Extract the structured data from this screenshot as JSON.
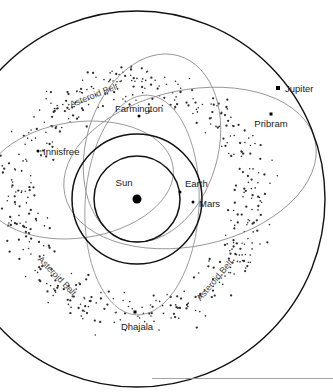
{
  "figure": {
    "kind": "solar-system-meteorite-orbit-diagram",
    "background": "#ffffff",
    "ink": "#111111",
    "meteor_orbit_color": "#8e8e8e",
    "belt_dot_color": "#2e2e2e"
  },
  "bodies": {
    "sun": {
      "label": "Sun"
    },
    "earth": {
      "label": "Earth"
    },
    "mars": {
      "label": "Mars"
    },
    "jupiter": {
      "label": "Jupiter"
    }
  },
  "meteorites": {
    "innisfree": {
      "label": "Innisfree"
    },
    "farmington": {
      "label": "Farmington"
    },
    "pribram": {
      "label": "Pribram"
    },
    "dhajala": {
      "label": "Dhajala"
    }
  },
  "belt_labels": [
    {
      "label": "Asteroid Belt"
    },
    {
      "label": "Asteroid Belt"
    },
    {
      "label": "Asteroid Belt"
    }
  ],
  "chart_data": {
    "type": "scatter",
    "title": "",
    "xlabel": "",
    "ylabel": "",
    "grid": false,
    "legend": "none",
    "center": {
      "x": 137,
      "y": 199
    },
    "circular_orbits": [
      {
        "name": "Earth",
        "radius_px": 43
      },
      {
        "name": "Mars",
        "radius_px": 65
      },
      {
        "name": "Jupiter",
        "radius_px": 188
      }
    ],
    "elliptical_orbits": [
      {
        "name": "Innisfree",
        "rx_px": 96,
        "ry_px": 58,
        "rotation_deg": -8,
        "cx": 78,
        "cy": 180
      },
      {
        "name": "Farmington",
        "rx_px": 66,
        "ry_px": 96,
        "rotation_deg": 16,
        "cx": 152,
        "cy": 148
      },
      {
        "name": "Pribram",
        "rx_px": 128,
        "ry_px": 78,
        "rotation_deg": -12,
        "cx": 190,
        "cy": 168
      },
      {
        "name": "Dhajala",
        "rx_px": 57,
        "ry_px": 110,
        "rotation_deg": 3,
        "cx": 142,
        "cy": 205
      }
    ],
    "point_markers": [
      {
        "name": "Sun",
        "x": 137,
        "y": 199,
        "shape": "disc",
        "size_px": 9
      },
      {
        "name": "Earth",
        "x": 180,
        "y": 192,
        "shape": "dot",
        "size_px": 3
      },
      {
        "name": "Mars",
        "x": 193,
        "y": 202,
        "shape": "dot",
        "size_px": 3
      },
      {
        "name": "Jupiter",
        "x": 278,
        "y": 88,
        "shape": "square",
        "size_px": 4
      },
      {
        "name": "Innisfree",
        "x": 38,
        "y": 151,
        "shape": "dot",
        "size_px": 3
      },
      {
        "name": "Farmington",
        "x": 139,
        "y": 116,
        "shape": "dot",
        "size_px": 3
      },
      {
        "name": "Pribram",
        "x": 271,
        "y": 114,
        "shape": "square",
        "size_px": 3
      },
      {
        "name": "Dhajala",
        "x": 135,
        "y": 312,
        "shape": "square",
        "size_px": 3
      }
    ],
    "asteroid_belt": {
      "inner_radius_px": 86,
      "outer_radius_px": 152,
      "point_count": 520,
      "annulus_center": {
        "x": 137,
        "y": 199
      }
    }
  }
}
